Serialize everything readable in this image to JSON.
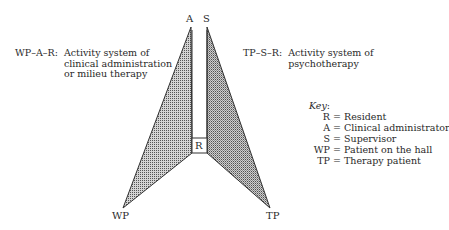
{
  "diagram": {
    "vertices": {
      "A": {
        "label": "A",
        "x": 191,
        "y": 27
      },
      "S": {
        "label": "S",
        "x": 207,
        "y": 27
      },
      "R": {
        "label": "R",
        "x": 199.5,
        "y": 145
      },
      "WP": {
        "label": "WP",
        "x": 123,
        "y": 208
      },
      "TP": {
        "label": "TP",
        "x": 270,
        "y": 208
      }
    },
    "colors": {
      "stroke": "#333333",
      "fill_left": "#9a9a9a",
      "fill_right": "#8f8f8f",
      "background": "#ffffff"
    }
  },
  "annotations": {
    "left": {
      "code": "WP–A–R:",
      "lines": [
        "Activity system of",
        "clinical administration",
        "or milieu therapy"
      ]
    },
    "right": {
      "code": "TP–S–R:",
      "lines": [
        "Activity system of",
        "psychotherapy"
      ]
    }
  },
  "key": {
    "title": "Key",
    "items": [
      {
        "abbr": "R",
        "definition": "Resident"
      },
      {
        "abbr": "A",
        "definition": "Clinical administrator"
      },
      {
        "abbr": "S",
        "definition": "Supervisor"
      },
      {
        "abbr": "WP",
        "definition": "Patient on the hall"
      },
      {
        "abbr": "TP",
        "definition": "Therapy patient"
      }
    ]
  }
}
